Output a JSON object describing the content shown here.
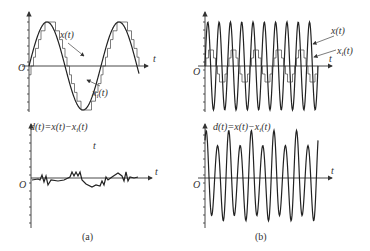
{
  "figure": {
    "panel_a": {
      "caption": "(a)",
      "top": {
        "origin_label": "O",
        "t_label": "t",
        "x_label": "x(t)",
        "xi_label": "x",
        "xi_sub": "i",
        "xi_tail": "(t)"
      },
      "bottom": {
        "d_label": "d(t)=x(t)−x",
        "d_sub": "i",
        "d_tail": "(t)",
        "t_inner_label": "t",
        "t_label": "t",
        "origin_label": "O"
      }
    },
    "panel_b": {
      "caption": "(b)",
      "top": {
        "origin_label": "O",
        "t_label": "t",
        "x_label": "x(t)",
        "xi_label": "x",
        "xi_sub": "i",
        "xi_tail": "(t)"
      },
      "bottom": {
        "d_label": "d(t)=x(t)−x",
        "d_sub": "i",
        "d_tail": "(t)",
        "t_label": "t",
        "origin_label": "O"
      }
    },
    "colors": {
      "line": "#222222",
      "text": "#333333",
      "background": "#ffffff"
    }
  }
}
